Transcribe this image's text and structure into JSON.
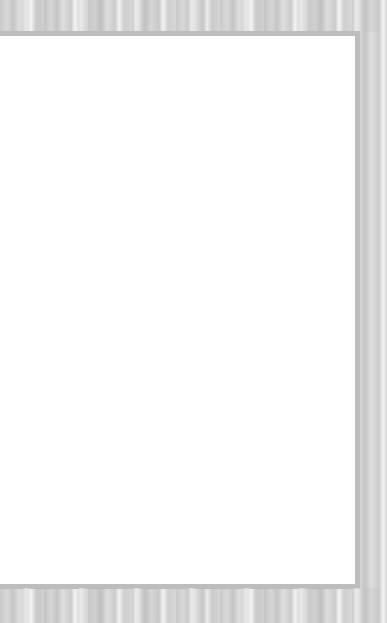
{
  "scene": {
    "description": "Blank white card on gray textured background",
    "colors": {
      "background": "#d0d0d0",
      "frame": "#bdbdbd",
      "card": "#ffffff"
    }
  }
}
